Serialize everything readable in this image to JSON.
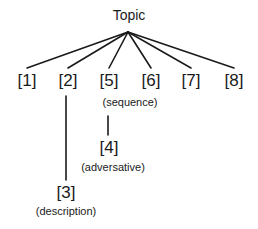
{
  "diagram": {
    "title": "Topic",
    "root": {
      "label": "Topic",
      "x": 129,
      "y": 8
    },
    "apex": {
      "x": 128,
      "y": 32
    },
    "top_nodes": [
      {
        "id": "1",
        "label": "[1]",
        "x": 27,
        "y": 72
      },
      {
        "id": "2",
        "label": "[2]",
        "x": 68,
        "y": 72
      },
      {
        "id": "5",
        "label": "[5]",
        "x": 109,
        "y": 72
      },
      {
        "id": "6",
        "label": "[6]",
        "x": 151,
        "y": 72
      },
      {
        "id": "7",
        "label": "[7]",
        "x": 191,
        "y": 72
      },
      {
        "id": "8",
        "label": "[8]",
        "x": 234,
        "y": 72
      }
    ],
    "annotations": {
      "sequence": {
        "label": "(sequence)",
        "x": 130,
        "y": 97,
        "applies_to": [
          "5",
          "6"
        ]
      }
    },
    "child_nodes": [
      {
        "id": "4",
        "label": "[4]",
        "relation": "(adversative)",
        "parent": "5",
        "x": 109,
        "y": 139,
        "relation_y": 162
      },
      {
        "id": "3",
        "label": "[3]",
        "relation": "(description)",
        "parent": "2",
        "x": 66,
        "y": 184,
        "relation_y": 206
      }
    ],
    "edges": [
      {
        "from": "Topic",
        "to": "1"
      },
      {
        "from": "Topic",
        "to": "2"
      },
      {
        "from": "Topic",
        "to": "5"
      },
      {
        "from": "Topic",
        "to": "6"
      },
      {
        "from": "Topic",
        "to": "7"
      },
      {
        "from": "Topic",
        "to": "8"
      },
      {
        "from": "5",
        "to": "4"
      },
      {
        "from": "2",
        "to": "3"
      }
    ],
    "line_color": "#1a1a1a"
  }
}
